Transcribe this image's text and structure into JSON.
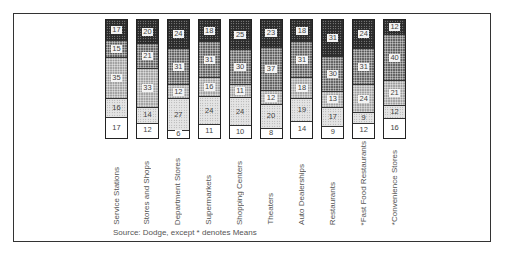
{
  "chart_data": {
    "type": "bar",
    "subtype": "stacked-100-percent",
    "title": "",
    "xlabel": "",
    "ylabel": "",
    "ylim": [
      0,
      100
    ],
    "categories": [
      "Service Stations",
      "Stores and Shops",
      "Department Stores",
      "Supermarkets",
      "Shopping Centers",
      "Theaters",
      "Auto Dealerships",
      "Restaurants",
      "*Fast Food Restaurants",
      "*Convenience Stores"
    ],
    "series_order_top_to_bottom": [
      "segment_1",
      "segment_2",
      "segment_3",
      "segment_4",
      "segment_5"
    ],
    "series": [
      {
        "name": "segment_1",
        "pattern": "darkest",
        "values": [
          17,
          20,
          24,
          18,
          25,
          23,
          18,
          31,
          24,
          12
        ]
      },
      {
        "name": "segment_2",
        "pattern": "dark",
        "values": [
          15,
          21,
          31,
          31,
          30,
          37,
          31,
          30,
          31,
          40
        ]
      },
      {
        "name": "segment_3",
        "pattern": "medium",
        "values": [
          35,
          33,
          12,
          16,
          11,
          12,
          18,
          13,
          24,
          21
        ]
      },
      {
        "name": "segment_4",
        "pattern": "light",
        "values": [
          16,
          14,
          27,
          24,
          24,
          20,
          19,
          17,
          9,
          12
        ]
      },
      {
        "name": "segment_5",
        "pattern": "white",
        "values": [
          17,
          12,
          6,
          11,
          10,
          8,
          14,
          9,
          12,
          16
        ]
      }
    ],
    "annotation": "Source: Dodge, except * denotes Means",
    "legend": null,
    "grid": false
  },
  "source_note": "Source: Dodge, except * denotes Means"
}
